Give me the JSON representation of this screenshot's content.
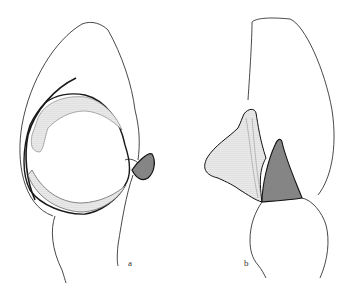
{
  "figure": {
    "type": "scientific line illustration",
    "panels": [
      {
        "id": "a",
        "label": "a",
        "description": "palp, ventral view"
      },
      {
        "id": "b",
        "label": "b",
        "description": "palp, lateral view"
      }
    ],
    "colors": {
      "line": "#1a1a1a",
      "stipple": "#9a9a9a",
      "background": "#ffffff"
    }
  }
}
